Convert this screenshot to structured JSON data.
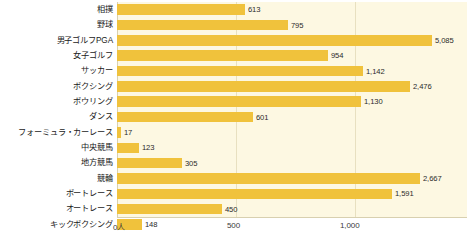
{
  "chart_data": {
    "type": "bar",
    "orientation": "horizontal",
    "title": "",
    "subtitle": "",
    "xlabel": "",
    "ylabel": "",
    "legend": [],
    "legend_position": "none",
    "grid": true,
    "xlim": [
      0,
      1500
    ],
    "x_unit_label": "0人",
    "x_ticks": [
      {
        "label": "0人",
        "value": 0,
        "px": 117
      },
      {
        "label": "500",
        "value": 500,
        "px": 236
      },
      {
        "label": "1,000",
        "value": 1000,
        "px": 355
      }
    ],
    "note": "Bars beyond 1,000 use a compressed (non-linear) scale in the original figure.",
    "categories": [
      "相撲",
      "野球",
      "男子ゴルフPGA",
      "女子ゴルフ",
      "サッカー",
      "ボクシング",
      "ボウリング",
      "ダンス",
      "フォーミュラ・カーレース",
      "中央競馬",
      "地方競馬",
      "競輪",
      "ボートレース",
      "オートレース",
      "キックボクシング"
    ],
    "values": [
      613,
      795,
      5085,
      954,
      1142,
      2476,
      1130,
      601,
      17,
      123,
      305,
      2667,
      1591,
      450,
      148
    ],
    "value_labels": [
      "613",
      "795",
      "5,085",
      "954",
      "1,142",
      "2,476",
      "1,130",
      "601",
      "17",
      "123",
      "305",
      "2,667",
      "1,591",
      "450",
      "148"
    ],
    "bar_pixel_widths": [
      128,
      171,
      315,
      211,
      246,
      293,
      244,
      136,
      4,
      22,
      65,
      303,
      275,
      105,
      25
    ],
    "colors": {
      "bar": "#f0c23c",
      "plot_background": "#fdf8e2",
      "gridline": "#e8e0c0",
      "text": "#1a1a1a",
      "page_background": "#ffffff"
    }
  }
}
